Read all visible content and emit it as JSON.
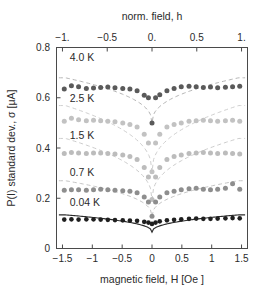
{
  "chart_data": {
    "type": "scatter",
    "title": "",
    "xlabel": "magnetic field, H [Oe ]",
    "ylabel": "P(I) standard dev., σ [μA]",
    "x2label": "norm. field, h",
    "xlim": [
      -1.6,
      1.6
    ],
    "ylim": [
      0,
      0.8
    ],
    "x2lim": [
      -1.0666,
      1.0666
    ],
    "grid": false,
    "legend": "inline annotations at left of each series",
    "xticks": [
      "−1.5",
      "−1",
      "−0.5",
      "0",
      "0.5",
      "1",
      "1.5"
    ],
    "xtickvalues": [
      -1.5,
      -1,
      -0.5,
      0,
      0.5,
      1,
      1.5
    ],
    "x2ticks": [
      "−1.",
      "−0.5",
      "0.",
      "0.5",
      "1."
    ],
    "x2tickvalues": [
      -1,
      -0.5,
      0,
      0.5,
      1
    ],
    "yticks": [
      "0",
      "0.2",
      "0.4",
      "0.6",
      "0.8"
    ],
    "ytickvalues": [
      0,
      0.2,
      0.4,
      0.6,
      0.8
    ],
    "series": [
      {
        "name": "4.0 K",
        "label": "4.0 K",
        "color": "#5a5a5a",
        "curve_color": "#b5b5b5",
        "curve_style": "dashed",
        "label_x": -1.38,
        "label_y": 0.745,
        "plateau": 0.638,
        "minimum": 0.5,
        "x": [
          -1.47,
          -1.35,
          -1.23,
          -1.1,
          -0.98,
          -0.86,
          -0.74,
          -0.62,
          -0.49,
          -0.37,
          -0.25,
          -0.13,
          -0.06,
          0.0,
          0.06,
          0.13,
          0.25,
          0.37,
          0.49,
          0.62,
          0.74,
          0.86,
          0.98,
          1.1,
          1.23,
          1.35,
          1.47
        ],
        "y": [
          0.635,
          0.648,
          0.644,
          0.637,
          0.639,
          0.641,
          0.643,
          0.64,
          0.637,
          0.635,
          0.628,
          0.61,
          0.6,
          0.5,
          0.6,
          0.612,
          0.628,
          0.637,
          0.644,
          0.646,
          0.644,
          0.641,
          0.643,
          0.64,
          0.642,
          0.644,
          0.646
        ]
      },
      {
        "name": "2.5 K",
        "label": "2.5 K",
        "color": "#c2c2c2",
        "curve_color": "#cfcfcf",
        "curve_style": "dashed",
        "label_x": -1.38,
        "label_y": 0.585,
        "plateau": 0.508,
        "minimum": 0.305,
        "x": [
          -1.47,
          -1.35,
          -1.23,
          -1.1,
          -0.98,
          -0.86,
          -0.74,
          -0.62,
          -0.49,
          -0.37,
          -0.25,
          -0.13,
          -0.06,
          0.0,
          0.06,
          0.13,
          0.25,
          0.37,
          0.49,
          0.62,
          0.74,
          0.86,
          0.98,
          1.1,
          1.23,
          1.35,
          1.47
        ],
        "y": [
          0.506,
          0.518,
          0.512,
          0.508,
          0.51,
          0.508,
          0.506,
          0.504,
          0.5,
          0.494,
          0.484,
          0.455,
          0.42,
          0.305,
          0.42,
          0.455,
          0.484,
          0.494,
          0.5,
          0.506,
          0.508,
          0.51,
          0.508,
          0.506,
          0.508,
          0.51,
          0.506
        ]
      },
      {
        "name": "1.5 K",
        "label": "1.5 K",
        "color": "#bcbcbc",
        "curve_color": "#cccccc",
        "curve_style": "dashed",
        "label_x": -1.38,
        "label_y": 0.437,
        "plateau": 0.382,
        "minimum": 0.195,
        "x": [
          -1.47,
          -1.35,
          -1.23,
          -1.1,
          -0.98,
          -0.86,
          -0.74,
          -0.62,
          -0.49,
          -0.37,
          -0.25,
          -0.13,
          -0.06,
          0.0,
          0.06,
          0.13,
          0.25,
          0.37,
          0.49,
          0.62,
          0.74,
          0.86,
          0.98,
          1.1,
          1.23,
          1.35,
          1.47
        ],
        "y": [
          0.378,
          0.382,
          0.38,
          0.378,
          0.38,
          0.38,
          0.378,
          0.376,
          0.372,
          0.366,
          0.354,
          0.322,
          0.285,
          0.195,
          0.285,
          0.322,
          0.354,
          0.366,
          0.372,
          0.378,
          0.38,
          0.382,
          0.38,
          0.378,
          0.38,
          0.378,
          0.376
        ]
      },
      {
        "name": "0.7 K",
        "label": "0.7 K",
        "color": "#8e8e8e",
        "curve_color": "#c4c4c4",
        "curve_style": "dashed",
        "label_x": -1.38,
        "label_y": 0.288,
        "plateau": 0.237,
        "minimum": 0.128,
        "x": [
          -1.47,
          -1.35,
          -1.23,
          -1.1,
          -0.98,
          -0.86,
          -0.74,
          -0.62,
          -0.49,
          -0.37,
          -0.25,
          -0.13,
          -0.06,
          0.0,
          0.06,
          0.13,
          0.25,
          0.37,
          0.49,
          0.62,
          0.74,
          0.86,
          0.98,
          1.1,
          1.23,
          1.35,
          1.47
        ],
        "y": [
          0.232,
          0.234,
          0.234,
          0.232,
          0.234,
          0.236,
          0.234,
          0.232,
          0.23,
          0.228,
          0.222,
          0.205,
          0.185,
          0.128,
          0.185,
          0.205,
          0.222,
          0.228,
          0.234,
          0.238,
          0.24,
          0.236,
          0.234,
          0.236,
          0.24,
          0.258,
          0.236
        ]
      },
      {
        "name": "0.04 K",
        "label": "0.04 K",
        "color": "#1f1f1f",
        "curve_color": "#2b2b2b",
        "curve_style": "solid",
        "label_x": -1.38,
        "label_y": 0.168,
        "plateau": 0.118,
        "minimum": 0.065,
        "x": [
          -1.47,
          -1.35,
          -1.23,
          -1.1,
          -0.98,
          -0.86,
          -0.74,
          -0.62,
          -0.49,
          -0.37,
          -0.25,
          -0.13,
          -0.06,
          0.0,
          0.06,
          0.13,
          0.25,
          0.37,
          0.49,
          0.62,
          0.74,
          0.86,
          0.98,
          1.1,
          1.23,
          1.35,
          1.47
        ],
        "y": [
          0.115,
          0.116,
          0.115,
          0.116,
          0.116,
          0.115,
          0.114,
          0.113,
          0.112,
          0.111,
          0.11,
          0.106,
          0.103,
          0.098,
          0.103,
          0.108,
          0.112,
          0.114,
          0.116,
          0.118,
          0.119,
          0.118,
          0.118,
          0.119,
          0.12,
          0.121,
          0.12
        ]
      }
    ]
  }
}
